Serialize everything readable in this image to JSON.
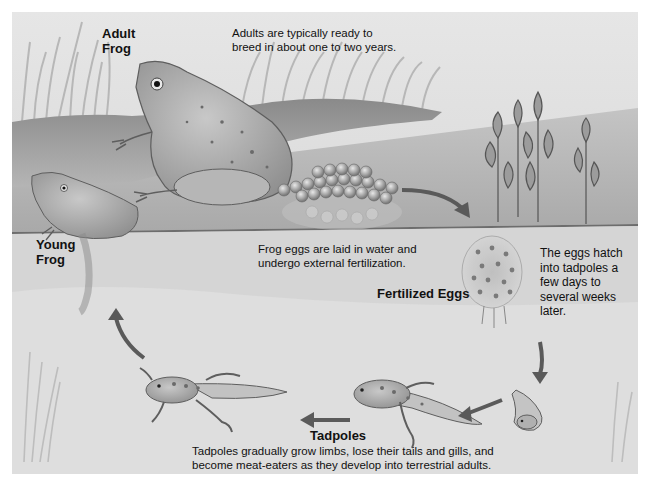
{
  "diagram": {
    "type": "life-cycle",
    "colors": {
      "background": "#e0e0e0",
      "water": "#b8b8b8",
      "arrow": "#555555",
      "text": "#111111"
    },
    "stages": [
      {
        "id": "adult",
        "label_line1": "Adult",
        "label_line2": "Frog",
        "description_line1": "Adults are typically ready to",
        "description_line2": "breed in about one to two years."
      },
      {
        "id": "eggs",
        "label": "Fertilized Eggs",
        "description_line1": "Frog eggs are laid in water and",
        "description_line2": "undergo external fertilization."
      },
      {
        "id": "hatch",
        "description_lines": [
          "The eggs hatch",
          "into tadpoles a",
          "few days to",
          "several weeks",
          "later."
        ]
      },
      {
        "id": "tadpoles",
        "label": "Tadpoles",
        "description_line1": "Tadpoles gradually grow limbs, lose their tails and gills, and",
        "description_line2": "become meat-eaters as they develop into terrestrial adults."
      },
      {
        "id": "young",
        "label_line1": "Young",
        "label_line2": "Frog"
      }
    ],
    "arrows": [
      {
        "from": "eggs-cluster",
        "to": "fertilized-eggs"
      },
      {
        "from": "fertilized-eggs",
        "to": "hatchling"
      },
      {
        "from": "hatchling",
        "to": "tadpole-1"
      },
      {
        "from": "tadpole-1",
        "to": "tadpole-2"
      },
      {
        "from": "tadpole-2",
        "to": "young-frog"
      }
    ]
  }
}
